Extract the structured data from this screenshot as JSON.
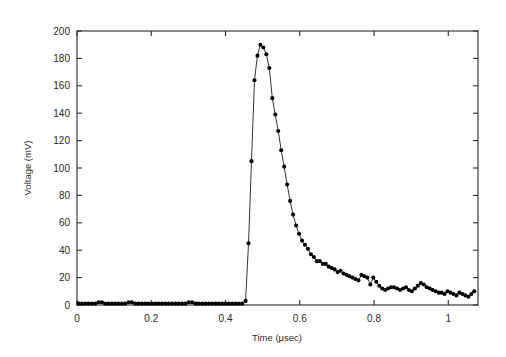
{
  "chart_data": {
    "type": "line",
    "title": "",
    "xlabel": "Time (μsec)",
    "ylabel": "Voltage (mV)",
    "xlim": [
      0,
      1.08
    ],
    "ylim": [
      0,
      200
    ],
    "xticks": [
      0,
      0.2,
      0.4,
      0.6,
      0.8,
      1
    ],
    "xticklabels": [
      "0",
      "0.2",
      "0.4",
      "0.6",
      "0.8",
      "1"
    ],
    "yticks": [
      0,
      20,
      40,
      60,
      80,
      100,
      120,
      140,
      160,
      180,
      200
    ],
    "yticklabels": [
      "0",
      "20",
      "40",
      "60",
      "80",
      "100",
      "120",
      "140",
      "160",
      "180",
      "200"
    ],
    "grid": false,
    "legend": null,
    "marker": "filled-circle",
    "marker_color": "#000000",
    "line_color": "#000000",
    "frame": "box-all-four-sides-ticks-inward",
    "series": [
      {
        "name": "Voltage pulse",
        "x": [
          0.004,
          0.013,
          0.022,
          0.031,
          0.04,
          0.049,
          0.058,
          0.067,
          0.076,
          0.085,
          0.094,
          0.103,
          0.112,
          0.121,
          0.13,
          0.139,
          0.148,
          0.157,
          0.166,
          0.175,
          0.184,
          0.193,
          0.202,
          0.211,
          0.22,
          0.229,
          0.238,
          0.247,
          0.256,
          0.265,
          0.274,
          0.283,
          0.292,
          0.301,
          0.31,
          0.319,
          0.328,
          0.337,
          0.346,
          0.355,
          0.364,
          0.373,
          0.382,
          0.391,
          0.4,
          0.409,
          0.418,
          0.427,
          0.436,
          0.445,
          0.454,
          0.462,
          0.47,
          0.478,
          0.486,
          0.494,
          0.502,
          0.51,
          0.518,
          0.526,
          0.534,
          0.542,
          0.55,
          0.558,
          0.566,
          0.574,
          0.582,
          0.59,
          0.598,
          0.606,
          0.614,
          0.622,
          0.63,
          0.638,
          0.646,
          0.654,
          0.662,
          0.67,
          0.678,
          0.686,
          0.694,
          0.702,
          0.71,
          0.718,
          0.726,
          0.734,
          0.742,
          0.75,
          0.758,
          0.766,
          0.774,
          0.782,
          0.79,
          0.798,
          0.806,
          0.814,
          0.822,
          0.83,
          0.838,
          0.846,
          0.854,
          0.862,
          0.87,
          0.878,
          0.886,
          0.894,
          0.902,
          0.91,
          0.918,
          0.926,
          0.934,
          0.942,
          0.95,
          0.958,
          0.966,
          0.974,
          0.982,
          0.99,
          0.998,
          1.006,
          1.014,
          1.022,
          1.03,
          1.038,
          1.046,
          1.054,
          1.062,
          1.07
        ],
        "y": [
          1,
          1,
          1,
          1,
          1,
          1,
          2,
          2,
          1,
          1,
          1,
          1,
          1,
          1,
          1,
          2,
          2,
          1,
          1,
          1,
          1,
          1,
          1,
          1,
          1,
          1,
          1,
          1,
          1,
          1,
          1,
          1,
          1,
          2,
          2,
          1,
          1,
          1,
          1,
          1,
          1,
          1,
          1,
          1,
          1,
          1,
          1,
          1,
          1,
          1,
          3,
          45,
          105,
          164,
          182,
          190,
          188,
          183,
          173,
          151,
          139,
          127,
          113,
          101,
          88,
          76,
          66,
          58,
          52,
          47,
          44,
          41,
          37,
          35,
          32,
          32,
          30,
          30,
          28,
          27,
          26,
          24,
          25,
          23,
          22,
          21,
          20,
          19,
          18,
          22,
          21,
          20,
          15,
          20,
          17,
          14,
          12,
          11,
          12,
          13,
          13,
          12,
          11,
          12,
          13,
          11,
          10,
          12,
          14,
          16,
          15,
          13,
          12,
          11,
          10,
          9,
          9,
          8,
          10,
          9,
          8,
          7,
          9,
          8,
          7,
          6,
          8,
          10
        ]
      }
    ]
  },
  "figure": {
    "background": "#ffffff",
    "axis_color": "#2b2b2b"
  }
}
